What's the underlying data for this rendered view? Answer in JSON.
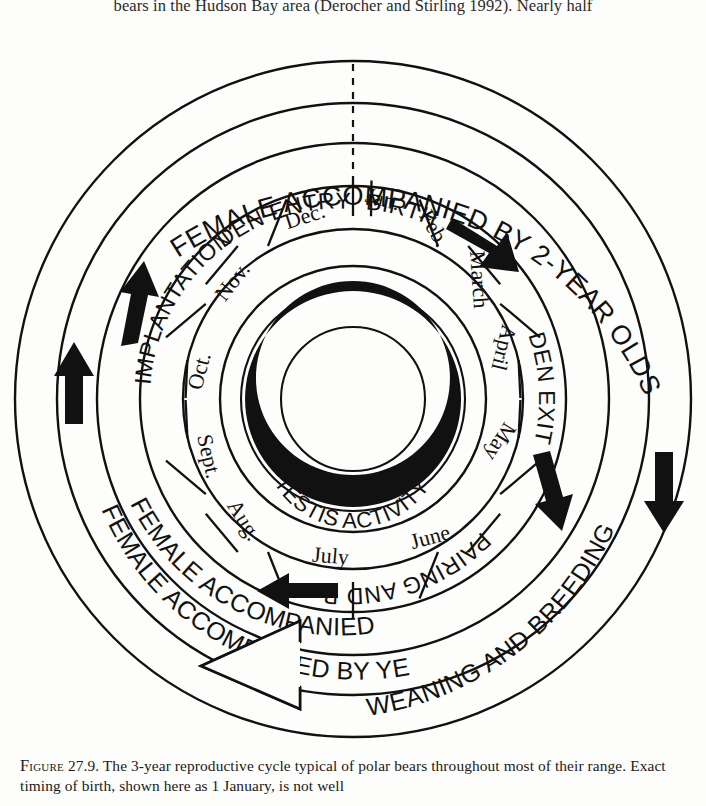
{
  "page": {
    "top_text": "bears in the Hudson Bay area (Derocher and Stirling 1992). Nearly half",
    "caption_label": "Figure",
    "caption_number": "27.9.",
    "caption_line1": "The 3-year reproductive cycle typical of polar bears throughout",
    "caption_line2": "most of their range. Exact timing of birth, shown here as 1 January, is not well"
  },
  "figure": {
    "outer_rings": [
      {
        "id": "ring-2year",
        "text": "FEMALE ACCOMPANIED BY 2-YEAR OLDS"
      },
      {
        "id": "ring-cubs",
        "text": "FEMALE ACCOMPANIED BY CUBS"
      },
      {
        "id": "ring-yearlings",
        "text": "FEMALE ACCOMPANIED BY YEARLINGS"
      }
    ],
    "event_labels": [
      {
        "id": "implantation",
        "text": "IMPLANTATION"
      },
      {
        "id": "den-entry",
        "text": "DEN ENTRY"
      },
      {
        "id": "birth",
        "text": "BIRTH"
      },
      {
        "id": "den-exit",
        "text": "DEN EXIT"
      },
      {
        "id": "pairing",
        "text": "PAIRING AND BREEDING"
      },
      {
        "id": "weaning",
        "text": "WEANING AND BREEDING"
      }
    ],
    "center_label": "TESTIS  ACTIVITY",
    "months": [
      "Jan.",
      "Feb.",
      "March",
      "April",
      "May",
      "June",
      "July",
      "Aug.",
      "Sept.",
      "Oct.",
      "Nov.",
      "Dec."
    ],
    "arrows": [
      {
        "id": "arrow-birth-cw",
        "style": "solid",
        "direction": "clockwise"
      },
      {
        "id": "arrow-2year-down",
        "style": "solid",
        "direction": "down"
      },
      {
        "id": "arrow-den-exit-down",
        "style": "solid",
        "direction": "down"
      },
      {
        "id": "arrow-pairing-left",
        "style": "solid",
        "direction": "left"
      },
      {
        "id": "arrow-cubs-up",
        "style": "solid",
        "direction": "up"
      },
      {
        "id": "arrow-yearlings-up",
        "style": "solid",
        "direction": "up"
      },
      {
        "id": "arrow-weaning-left",
        "style": "hollow",
        "direction": "left"
      }
    ],
    "colors": {
      "ink": "#111111",
      "paper": "#fdfdfb"
    }
  }
}
